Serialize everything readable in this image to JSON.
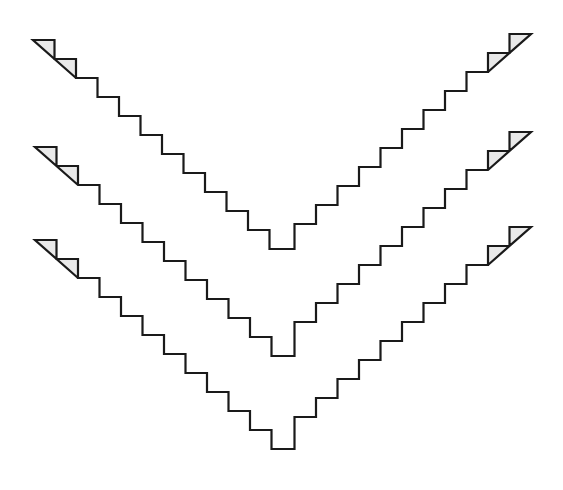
{
  "figure": {
    "name": "stepped-chevron-illustration",
    "background_color": "#ffffff",
    "fill_color": "#e9e9e9",
    "stroke_color": "#1a1a1a",
    "stroke_width": 2.2,
    "watermark": "",
    "geometry": {
      "step_width": 21.5,
      "step_height": 19.0,
      "steps_per_arm": 11,
      "apex_x": 281,
      "band_thickness_steps": 2
    },
    "chevrons": [
      {
        "name": "chevron-top",
        "index": 1,
        "left_start_x": 33,
        "left_start_y": 40,
        "right_start_x": 531,
        "right_start_y": 34,
        "apex_y": 232
      },
      {
        "name": "chevron-middle",
        "index": 2,
        "left_start_x": 35,
        "left_start_y": 147,
        "right_start_x": 531,
        "right_start_y": 132,
        "apex_y": 327
      },
      {
        "name": "chevron-bottom",
        "index": 3,
        "left_start_x": 35,
        "left_start_y": 240,
        "right_start_x": 531,
        "right_start_y": 227,
        "apex_y": 462
      }
    ]
  },
  "chart_data": {
    "type": "line",
    "xlabel": "",
    "ylabel": "",
    "xlim": [
      0,
      563
    ],
    "ylim": [
      490,
      0
    ],
    "grid": false,
    "legend": "none",
    "series": [
      {
        "name": "chevron-top",
        "note": "Outer staircase V, 11 steps per arm",
        "x": [
          33,
          281,
          531
        ],
        "values": [
          40,
          232,
          34
        ]
      },
      {
        "name": "chevron-middle",
        "note": "Middle staircase V, 11 steps per arm",
        "x": [
          35,
          281,
          531
        ],
        "values": [
          147,
          327,
          132
        ]
      },
      {
        "name": "chevron-bottom",
        "note": "Inner staircase V, 11 steps per arm",
        "x": [
          35,
          281,
          531
        ],
        "values": [
          240,
          462,
          227
        ]
      }
    ]
  }
}
